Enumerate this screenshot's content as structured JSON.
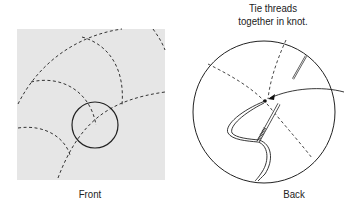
{
  "diagram": {
    "front": {
      "caption": "Front",
      "background_color": "#e6e6e6",
      "stitch_color": "#333333"
    },
    "back": {
      "caption": "Back",
      "annotation": {
        "line1": "Tie threads",
        "line2": "together in knot."
      }
    }
  }
}
